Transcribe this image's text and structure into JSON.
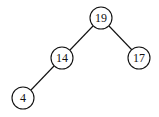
{
  "diagram": {
    "type": "binary-tree",
    "nodes": [
      {
        "id": "n19",
        "label": "19",
        "x": 101,
        "y": 18
      },
      {
        "id": "n14",
        "label": "14",
        "x": 62,
        "y": 58
      },
      {
        "id": "n17",
        "label": "17",
        "x": 139,
        "y": 58
      },
      {
        "id": "n4",
        "label": "4",
        "x": 23,
        "y": 98
      }
    ],
    "edges": [
      {
        "from": "n19",
        "to": "n14"
      },
      {
        "from": "n19",
        "to": "n17"
      },
      {
        "from": "n14",
        "to": "n4"
      }
    ],
    "colors": {
      "stroke": "#111111",
      "fill": "#ffffff",
      "text": "#111111"
    }
  }
}
